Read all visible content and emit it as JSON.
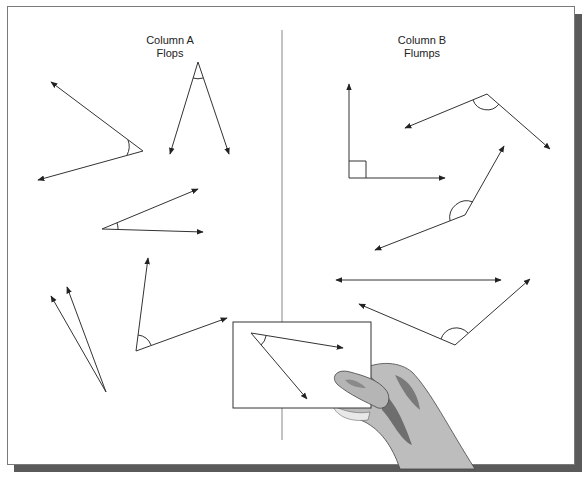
{
  "column_a": {
    "title": "Column A",
    "subtitle": "Flops"
  },
  "column_b": {
    "title": "Column B",
    "subtitle": "Flumps"
  },
  "colors": {
    "line": "#333333",
    "frame": "#7a7a7a",
    "shadow": "#5a5a5a",
    "hand_light": "#bdbdbd",
    "hand_dark": "#6e6e6e"
  }
}
